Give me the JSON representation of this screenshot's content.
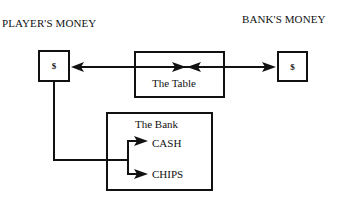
{
  "diagram": {
    "player_money_label": "PLAYER'S MONEY",
    "bank_money_label": "BANK'S MONEY",
    "player_box": {
      "symbol": "$"
    },
    "bank_box": {
      "symbol": "$"
    },
    "table": {
      "label": "The Table"
    },
    "bank": {
      "label": "The Bank",
      "items": [
        "CASH",
        "CHIPS"
      ]
    },
    "colors": {
      "line": "#111111",
      "background": "#ffffff"
    }
  }
}
